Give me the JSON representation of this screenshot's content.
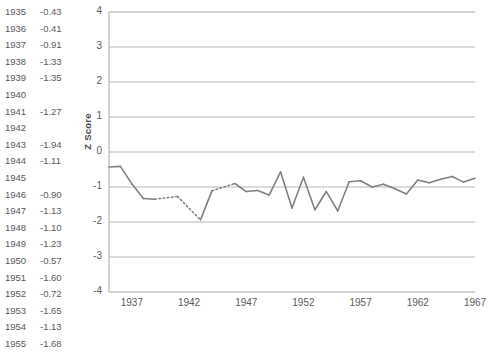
{
  "table": {
    "rows": [
      {
        "year": "1935",
        "value": "-0.43"
      },
      {
        "year": "1936",
        "value": "-0.41"
      },
      {
        "year": "1937",
        "value": "-0.91"
      },
      {
        "year": "1938",
        "value": "-1.33"
      },
      {
        "year": "1939",
        "value": "-1.35"
      },
      {
        "year": "1940",
        "value": ""
      },
      {
        "year": "1941",
        "value": "-1.27"
      },
      {
        "year": "1942",
        "value": ""
      },
      {
        "year": "1943",
        "value": "-1.94"
      },
      {
        "year": "1944",
        "value": "-1.11"
      },
      {
        "year": "1945",
        "value": ""
      },
      {
        "year": "1946",
        "value": "-0.90"
      },
      {
        "year": "1947",
        "value": "-1.13"
      },
      {
        "year": "1948",
        "value": "-1.10"
      },
      {
        "year": "1949",
        "value": "-1.23"
      },
      {
        "year": "1950",
        "value": "-0.57"
      },
      {
        "year": "1951",
        "value": "-1.60"
      },
      {
        "year": "1952",
        "value": "-0.72"
      },
      {
        "year": "1953",
        "value": "-1.65"
      },
      {
        "year": "1954",
        "value": "-1.13"
      },
      {
        "year": "1955",
        "value": "-1.68"
      }
    ]
  },
  "chart_data": {
    "type": "line",
    "title": "",
    "xlabel": "",
    "ylabel": "Z Score",
    "ylim": [
      -4,
      4
    ],
    "xlim": [
      1935,
      1967
    ],
    "ytick_labels": [
      "4",
      "3",
      "2",
      "1",
      "0",
      "-1",
      "-2",
      "-3",
      "-4"
    ],
    "ytick_values": [
      4,
      3,
      2,
      1,
      0,
      -1,
      -2,
      -3,
      -4
    ],
    "xtick_labels": [
      "1937",
      "1942",
      "1947",
      "1952",
      "1957",
      "1962",
      "1967"
    ],
    "xtick_values": [
      1937,
      1942,
      1947,
      1952,
      1957,
      1962,
      1967
    ],
    "grid": true,
    "legend": "none",
    "line_color": "#808080",
    "x": [
      1935,
      1936,
      1937,
      1938,
      1939,
      1940,
      1941,
      1942,
      1943,
      1944,
      1945,
      1946,
      1947,
      1948,
      1949,
      1950,
      1951,
      1952,
      1953,
      1954,
      1955,
      1956,
      1957,
      1958,
      1959,
      1960,
      1961,
      1962,
      1963,
      1964,
      1965,
      1966,
      1967
    ],
    "series": [
      {
        "name": "Z Score",
        "values": [
          -0.43,
          -0.41,
          -0.91,
          -1.33,
          -1.35,
          null,
          -1.27,
          null,
          -1.94,
          -1.11,
          null,
          -0.9,
          -1.13,
          -1.1,
          -1.23,
          -0.57,
          -1.6,
          -0.72,
          -1.65,
          -1.13,
          -1.68,
          -0.85,
          -0.82,
          -1.0,
          -0.92,
          -1.05,
          -1.2,
          -0.8,
          -0.88,
          -0.78,
          -0.7,
          -0.86,
          -0.75
        ]
      }
    ],
    "missing_years": [
      1940,
      1942,
      1945
    ],
    "note": "Dotted line segments span interpolated gaps at missing years"
  }
}
